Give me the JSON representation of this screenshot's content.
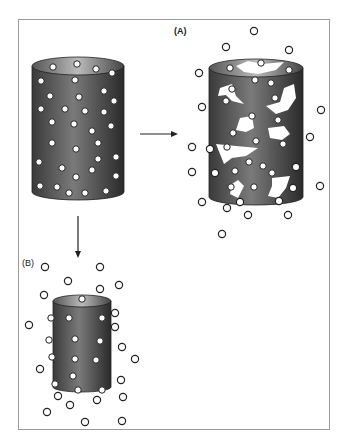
{
  "figure": {
    "label_a": "(A)",
    "label_b": "(B)",
    "colors": {
      "cylinder_dark": "#2e2e2e",
      "cylinder_light": "#8a8a8a",
      "particle_fill": "#ffffff",
      "particle_stroke": "#222222",
      "frame": "#9a9a9a"
    }
  },
  "panels": [
    {
      "name": "original",
      "embedded_particles": 38
    },
    {
      "name": "A-eroded",
      "embedded_particles": 20,
      "released_particles": 16
    },
    {
      "name": "B-shrunk",
      "embedded_particles": 14,
      "released_particles": 24
    }
  ]
}
